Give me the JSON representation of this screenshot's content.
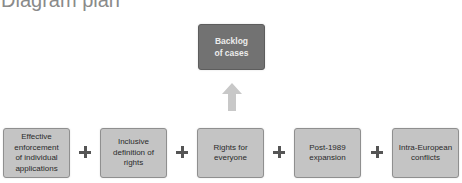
{
  "title": "Diagram plan",
  "result": {
    "label_line1": "Backlog",
    "label_line2": "of cases",
    "color": "#727272"
  },
  "arrow": {
    "direction": "up",
    "color": "#c8c8c8"
  },
  "causes": [
    {
      "lines": [
        "Effective",
        "enforcement",
        "of individual",
        "applications"
      ]
    },
    {
      "lines": [
        "Inclusive",
        "definition of",
        "rights"
      ]
    },
    {
      "lines": [
        "Rights for",
        "everyone"
      ]
    },
    {
      "lines": [
        "Post-1989",
        "expansion"
      ]
    },
    {
      "lines": [
        "Intra-European",
        "conflicts"
      ]
    }
  ],
  "operator": "+",
  "colors": {
    "cause_fill": "#c4c4c4",
    "cause_border": "#8f8f8f",
    "plus": "#555555",
    "title": "#8a8a8a"
  }
}
